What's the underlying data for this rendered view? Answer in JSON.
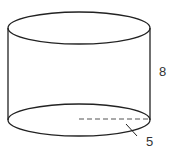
{
  "diagram": {
    "shape": "cylinder",
    "labels": {
      "height": "8",
      "radius": "5"
    },
    "colors": {
      "stroke": "#222222",
      "dash": "#555555",
      "background": "#ffffff"
    }
  }
}
